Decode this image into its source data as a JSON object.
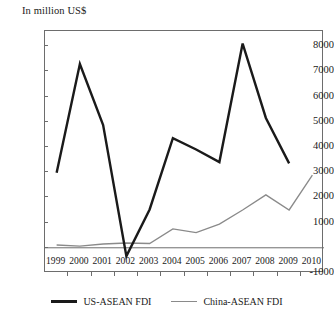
{
  "chart_data": {
    "type": "line",
    "title": "In million US$",
    "xlabel": "",
    "ylabel": "",
    "ylim": [
      -1000,
      8600
    ],
    "ytick_labels": [
      "8000",
      "7000",
      "6000",
      "5000",
      "4000",
      "3000",
      "2000",
      "1000",
      "",
      "-1000"
    ],
    "ytick_values": [
      8000,
      7000,
      6000,
      5000,
      4000,
      3000,
      2000,
      1000,
      0,
      -1000
    ],
    "grid": false,
    "legend_position": "bottom",
    "categories": [
      "1999",
      "2000",
      "2001",
      "2002",
      "2003",
      "2004",
      "2005",
      "2006",
      "2007",
      "2008",
      "2009",
      "2010"
    ],
    "series": [
      {
        "name": "US-ASEAN FDI",
        "color": "#1a1a1a",
        "width": 2.4,
        "values": [
          2980,
          7290,
          4870,
          -330,
          1520,
          4350,
          3900,
          3400,
          8100,
          5150,
          3350,
          null
        ]
      },
      {
        "name": "China-ASEAN FDI",
        "color": "#8a8a8a",
        "width": 1.3,
        "values": [
          110,
          70,
          150,
          190,
          170,
          750,
          600,
          940,
          1500,
          2100,
          1500,
          2880
        ]
      }
    ]
  },
  "legend": {
    "entries": [
      {
        "label": "US-ASEAN FDI",
        "swatch": "us-line-swatch"
      },
      {
        "label": "China-ASEAN FDI",
        "swatch": "china-line-swatch"
      }
    ]
  },
  "icons": {
    "us_line": "line-swatch-icon",
    "china_line": "line-swatch-icon"
  }
}
